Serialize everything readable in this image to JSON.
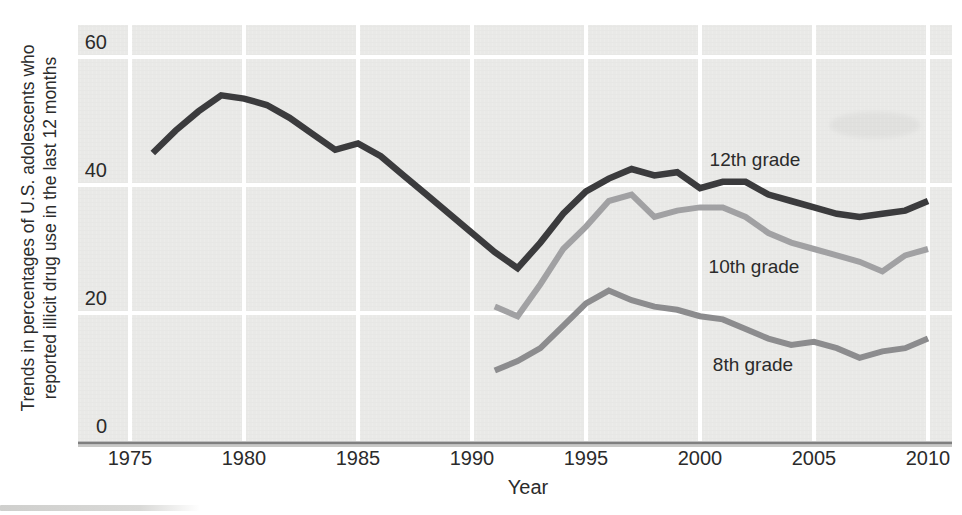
{
  "figure": {
    "ylabel_line1": "Trends in percentages of U.S. adolescents who",
    "ylabel_line2": "reported illicit drug use in the last 12 months",
    "xlabel": "Year"
  },
  "chart_data": {
    "type": "line",
    "title": "",
    "xlabel": "Year",
    "ylabel": "Trends in percentages of U.S. adolescents who reported illicit drug use in the last 12 months",
    "x_ticks": [
      1975,
      1980,
      1985,
      1990,
      1995,
      2000,
      2005,
      2010
    ],
    "y_ticks": [
      0,
      20,
      40,
      60
    ],
    "xlim": [
      1972.7,
      2011.1
    ],
    "ylim": [
      0,
      65
    ],
    "grid": true,
    "gridline_color": "#ffffff",
    "plot_background": "#e9e9e7",
    "axis_color": "#7f7f7f",
    "text_color": "#2b2b2b",
    "legend_position": "inline-labels",
    "series": [
      {
        "name": "12th grade",
        "color": "#3b3b3d",
        "x": [
          1976,
          1977,
          1978,
          1979,
          1980,
          1981,
          1982,
          1983,
          1984,
          1985,
          1986,
          1987,
          1988,
          1989,
          1990,
          1991,
          1992,
          1993,
          1994,
          1995,
          1996,
          1997,
          1998,
          1999,
          2000,
          2001,
          2002,
          2003,
          2004,
          2005,
          2006,
          2007,
          2008,
          2009,
          2010
        ],
        "values": [
          45,
          48.5,
          51.5,
          54,
          53.5,
          52.5,
          50.5,
          48,
          45.5,
          46.5,
          44.5,
          41.5,
          38.5,
          35.5,
          32.5,
          29.5,
          27,
          31,
          35.5,
          39,
          41,
          42.5,
          41.5,
          42,
          39.5,
          40.5,
          40.5,
          38.5,
          37.5,
          36.5,
          35.5,
          35,
          35.5,
          36,
          37.5
        ]
      },
      {
        "name": "10th grade",
        "color": "#a1a1a3",
        "x": [
          1991,
          1992,
          1993,
          1994,
          1995,
          1996,
          1997,
          1998,
          1999,
          2000,
          2001,
          2002,
          2003,
          2004,
          2005,
          2006,
          2007,
          2008,
          2009,
          2010
        ],
        "values": [
          21,
          19.5,
          24.5,
          30,
          33.5,
          37.5,
          38.5,
          35,
          36,
          36.5,
          36.5,
          35,
          32.5,
          31,
          30,
          29,
          28,
          26.5,
          29,
          30
        ]
      },
      {
        "name": "8th grade",
        "color": "#8c8c8e",
        "x": [
          1991,
          1992,
          1993,
          1994,
          1995,
          1996,
          1997,
          1998,
          1999,
          2000,
          2001,
          2002,
          2003,
          2004,
          2005,
          2006,
          2007,
          2008,
          2009,
          2010
        ],
        "values": [
          11,
          12.5,
          14.5,
          18,
          21.5,
          23.5,
          22,
          21,
          20.5,
          19.5,
          19,
          17.5,
          16,
          15,
          15.5,
          14.5,
          13,
          14,
          14.5,
          16
        ]
      }
    ]
  }
}
